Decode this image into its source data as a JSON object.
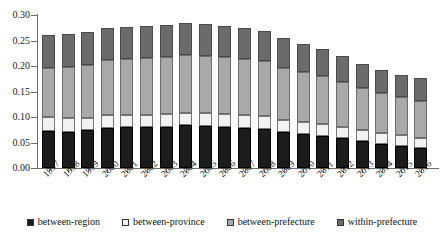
{
  "chart_data": {
    "type": "bar",
    "subtype": "stacked-vertical",
    "title": "",
    "xlabel": "",
    "ylabel": "",
    "ylim": [
      0.0,
      0.3
    ],
    "ytick_labels": [
      "0.00",
      "0.05",
      "0.10",
      "0.15",
      "0.20",
      "0.25",
      "0.30"
    ],
    "ytick_values": [
      0.0,
      0.05,
      0.1,
      0.15,
      0.2,
      0.25,
      0.3
    ],
    "grid": false,
    "legend_position": "bottom",
    "categories": [
      "1997",
      "1998",
      "1999",
      "2000",
      "2001",
      "2002",
      "2003",
      "2004",
      "2005",
      "2006",
      "2007",
      "2008",
      "2009",
      "2010",
      "2011",
      "2012",
      "2013",
      "2014",
      "2015",
      "2016"
    ],
    "series": [
      {
        "name": "between-region",
        "color": "#1c1c1c",
        "values": [
          0.073,
          0.071,
          0.074,
          0.079,
          0.08,
          0.08,
          0.081,
          0.084,
          0.082,
          0.08,
          0.079,
          0.077,
          0.071,
          0.067,
          0.063,
          0.058,
          0.052,
          0.047,
          0.043,
          0.039
        ]
      },
      {
        "name": "between-province",
        "color": "#f2f2f2",
        "values": [
          0.027,
          0.027,
          0.025,
          0.024,
          0.024,
          0.024,
          0.024,
          0.024,
          0.025,
          0.025,
          0.025,
          0.025,
          0.024,
          0.023,
          0.023,
          0.022,
          0.022,
          0.022,
          0.021,
          0.02
        ]
      },
      {
        "name": "between-prefecture",
        "color": "#a9a9a9",
        "values": [
          0.096,
          0.1,
          0.103,
          0.108,
          0.11,
          0.111,
          0.112,
          0.114,
          0.113,
          0.112,
          0.11,
          0.107,
          0.102,
          0.098,
          0.094,
          0.089,
          0.083,
          0.079,
          0.075,
          0.073
        ]
      },
      {
        "name": "within-prefecture",
        "color": "#6b6b6b",
        "values": [
          0.065,
          0.065,
          0.064,
          0.063,
          0.063,
          0.063,
          0.063,
          0.062,
          0.062,
          0.062,
          0.061,
          0.06,
          0.057,
          0.055,
          0.053,
          0.05,
          0.047,
          0.045,
          0.044,
          0.044
        ]
      }
    ],
    "totals": [
      0.261,
      0.263,
      0.266,
      0.274,
      0.277,
      0.278,
      0.28,
      0.284,
      0.282,
      0.279,
      0.275,
      0.269,
      0.254,
      0.243,
      0.233,
      0.219,
      0.204,
      0.193,
      0.183,
      0.176
    ]
  },
  "legend": {
    "items": [
      {
        "label": "between-region",
        "swatch": "black-square-icon"
      },
      {
        "label": "between-province",
        "swatch": "white-square-icon"
      },
      {
        "label": "between-prefecture",
        "swatch": "light-gray-square-icon"
      },
      {
        "label": "within-prefecture",
        "swatch": "dark-gray-square-icon"
      }
    ]
  }
}
